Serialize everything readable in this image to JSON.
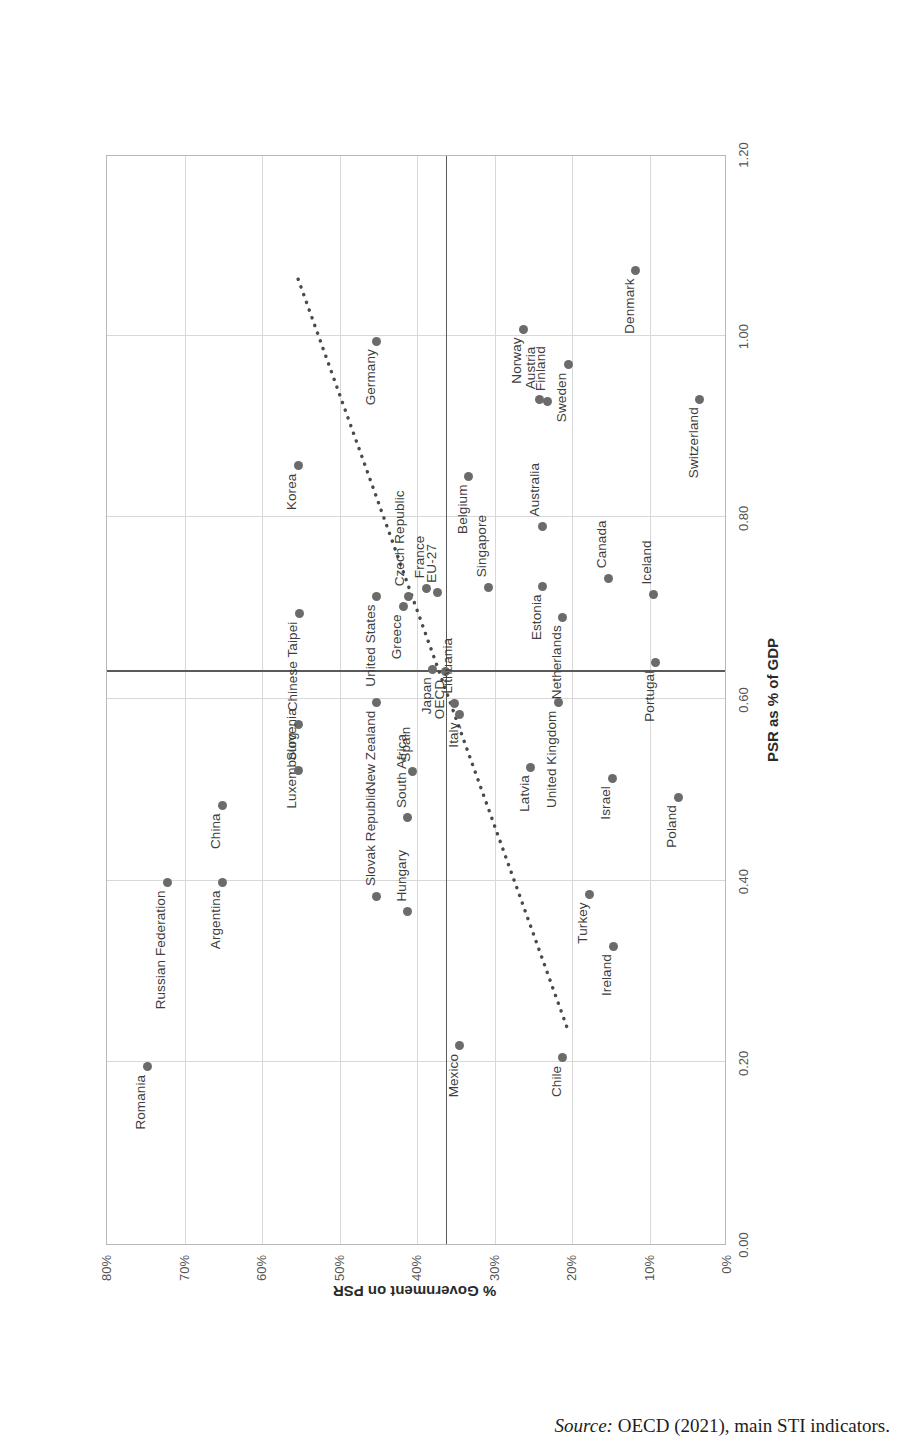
{
  "source_note": {
    "prefix": "Source:",
    "text": " OECD (2021), main STI indicators."
  },
  "axes": {
    "x_title": "PSR as % of GDP",
    "y_title": "% Government on PSR",
    "x_ticks": [
      "0.00",
      "0.20",
      "0.40",
      "0.60",
      "0.80",
      "1.00",
      "1.20"
    ],
    "y_ticks": [
      "0%",
      "10%",
      "20%",
      "30%",
      "40%",
      "50%",
      "60%",
      "70%",
      "80%"
    ],
    "x_min": 0.0,
    "x_max": 1.2,
    "y_min": 0.0,
    "y_max": 0.8
  },
  "reference_lines": {
    "x_value": 0.63,
    "y_value": 0.363
  },
  "colors": {
    "point": "#6b6b6b",
    "gridline": "#d8d8d8",
    "refline": "#5a5a5a",
    "trendline": "#4a4a4a",
    "label_text": "#3d3d3d"
  },
  "chart_data": {
    "type": "scatter",
    "title": "",
    "xlabel": "PSR as % of GDP",
    "ylabel": "% Government on PSR",
    "xlim": [
      0.0,
      1.2
    ],
    "ylim": [
      0.0,
      0.8
    ],
    "grid": true,
    "legend": "none",
    "annotations": [
      "Vertical reference line at PSR = 0.63",
      "Horizontal reference line at % Government on PSR = 36.3%",
      "Dotted linear trend line"
    ],
    "trendline": {
      "type": "linear",
      "x_start": 0.24,
      "y_start": 0.205,
      "x_end": 1.07,
      "y_end": 0.555
    },
    "points": [
      {
        "label": "Romania",
        "x": 0.195,
        "y": 0.748,
        "lx": -8,
        "ly": -14,
        "anchor": "end"
      },
      {
        "label": "Russian Federation",
        "x": 0.398,
        "y": 0.722,
        "lx": -8,
        "ly": -14,
        "anchor": "end"
      },
      {
        "label": "Argentina",
        "x": 0.398,
        "y": 0.651,
        "lx": -8,
        "ly": -14,
        "anchor": "end"
      },
      {
        "label": "China",
        "x": 0.483,
        "y": 0.651,
        "lx": -8,
        "ly": -14,
        "anchor": "end"
      },
      {
        "label": "Luxembourg",
        "x": 0.572,
        "y": 0.553,
        "lx": -8,
        "ly": -14,
        "anchor": "end"
      },
      {
        "label": "Slovenia",
        "x": 0.521,
        "y": 0.553,
        "lx": 10,
        "ly": -14,
        "anchor": "start"
      },
      {
        "label": "New Zealand",
        "x": 0.596,
        "y": 0.452,
        "lx": -8,
        "ly": -14,
        "anchor": "end"
      },
      {
        "label": "Slovak Republic",
        "x": 0.383,
        "y": 0.452,
        "lx": 10,
        "ly": -14,
        "anchor": "start"
      },
      {
        "label": "Hungary",
        "x": 0.366,
        "y": 0.412,
        "lx": 10,
        "ly": -14,
        "anchor": "start"
      },
      {
        "label": "South Africa",
        "x": 0.469,
        "y": 0.412,
        "lx": 10,
        "ly": -14,
        "anchor": "start"
      },
      {
        "label": "Spain",
        "x": 0.52,
        "y": 0.406,
        "lx": 10,
        "ly": -14,
        "anchor": "start"
      },
      {
        "label": "Chinese Taipei",
        "x": 0.694,
        "y": 0.552,
        "lx": -8,
        "ly": -14,
        "anchor": "end"
      },
      {
        "label": "United States",
        "x": 0.713,
        "y": 0.452,
        "lx": -8,
        "ly": -14,
        "anchor": "end"
      },
      {
        "label": "Greece",
        "x": 0.702,
        "y": 0.418,
        "lx": -8,
        "ly": -14,
        "anchor": "end"
      },
      {
        "label": "Czech Republic",
        "x": 0.713,
        "y": 0.411,
        "lx": 10,
        "ly": -16,
        "anchor": "start"
      },
      {
        "label": "Japan",
        "x": 0.633,
        "y": 0.38,
        "lx": -8,
        "ly": -14,
        "anchor": "end"
      },
      {
        "label": "France",
        "x": 0.722,
        "y": 0.388,
        "lx": 10,
        "ly": -14,
        "anchor": "start"
      },
      {
        "label": "OECD",
        "x": 0.63,
        "y": 0.363,
        "lx": -8,
        "ly": -14,
        "anchor": "end"
      },
      {
        "label": "EU-27",
        "x": 0.717,
        "y": 0.373,
        "lx": 10,
        "ly": -14,
        "anchor": "start"
      },
      {
        "label": "Lithuania",
        "x": 0.595,
        "y": 0.352,
        "lx": 10,
        "ly": -14,
        "anchor": "start"
      },
      {
        "label": "Italy",
        "x": 0.583,
        "y": 0.345,
        "lx": -8,
        "ly": -14,
        "anchor": "end"
      },
      {
        "label": "Germany",
        "x": 0.994,
        "y": 0.452,
        "lx": -8,
        "ly": -14,
        "anchor": "end"
      },
      {
        "label": "Korea",
        "x": 0.857,
        "y": 0.553,
        "lx": -8,
        "ly": -14,
        "anchor": "end"
      },
      {
        "label": "Belgium",
        "x": 0.845,
        "y": 0.333,
        "lx": -8,
        "ly": -14,
        "anchor": "end"
      },
      {
        "label": "Singapore",
        "x": 0.723,
        "y": 0.308,
        "lx": 10,
        "ly": -14,
        "anchor": "start"
      },
      {
        "label": "Norway",
        "x": 1.007,
        "y": 0.263,
        "lx": -8,
        "ly": -14,
        "anchor": "end"
      },
      {
        "label": "Austria",
        "x": 0.93,
        "y": 0.242,
        "lx": 10,
        "ly": -16,
        "anchor": "start"
      },
      {
        "label": "Finland",
        "x": 0.928,
        "y": 0.232,
        "lx": 10,
        "ly": -14,
        "anchor": "start"
      },
      {
        "label": "Australia",
        "x": 0.79,
        "y": 0.238,
        "lx": 10,
        "ly": -16,
        "anchor": "start"
      },
      {
        "label": "Estonia",
        "x": 0.724,
        "y": 0.238,
        "lx": -8,
        "ly": -14,
        "anchor": "end"
      },
      {
        "label": "Sweden",
        "x": 0.968,
        "y": 0.205,
        "lx": -8,
        "ly": -14,
        "anchor": "end"
      },
      {
        "label": "Netherlands",
        "x": 0.69,
        "y": 0.212,
        "lx": -8,
        "ly": -14,
        "anchor": "end"
      },
      {
        "label": "Canada",
        "x": 0.733,
        "y": 0.153,
        "lx": 10,
        "ly": -14,
        "anchor": "start"
      },
      {
        "label": "Iceland",
        "x": 0.715,
        "y": 0.095,
        "lx": 10,
        "ly": -14,
        "anchor": "start"
      },
      {
        "label": "Portugal",
        "x": 0.64,
        "y": 0.092,
        "lx": -8,
        "ly": -14,
        "anchor": "end"
      },
      {
        "label": "Switzerland",
        "x": 0.93,
        "y": 0.035,
        "lx": -8,
        "ly": -14,
        "anchor": "end"
      },
      {
        "label": "Denmark",
        "x": 1.072,
        "y": 0.118,
        "lx": -8,
        "ly": -14,
        "anchor": "end"
      },
      {
        "label": "United Kingdom",
        "x": 0.596,
        "y": 0.218,
        "lx": -8,
        "ly": -14,
        "anchor": "end"
      },
      {
        "label": "Latvia",
        "x": 0.525,
        "y": 0.253,
        "lx": -8,
        "ly": -14,
        "anchor": "end"
      },
      {
        "label": "Israel",
        "x": 0.513,
        "y": 0.148,
        "lx": -8,
        "ly": -14,
        "anchor": "end"
      },
      {
        "label": "Turkey",
        "x": 0.385,
        "y": 0.178,
        "lx": -8,
        "ly": -14,
        "anchor": "end"
      },
      {
        "label": "Ireland",
        "x": 0.328,
        "y": 0.147,
        "lx": -8,
        "ly": -14,
        "anchor": "end"
      },
      {
        "label": "Poland",
        "x": 0.492,
        "y": 0.063,
        "lx": -8,
        "ly": -14,
        "anchor": "end"
      },
      {
        "label": "Mexico",
        "x": 0.218,
        "y": 0.345,
        "lx": -8,
        "ly": -14,
        "anchor": "end"
      },
      {
        "label": "Chile",
        "x": 0.205,
        "y": 0.212,
        "lx": -8,
        "ly": -14,
        "anchor": "end"
      }
    ]
  }
}
